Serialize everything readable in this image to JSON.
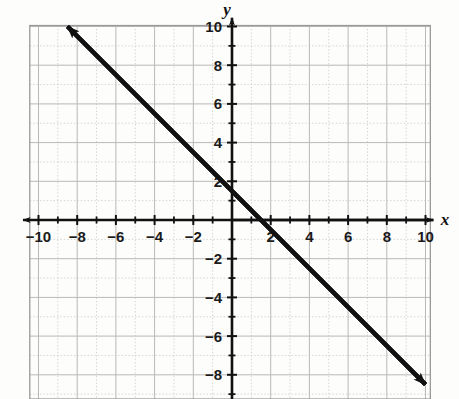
{
  "figure": {
    "kind": "coordinate-plane-line-graph",
    "background_color": "#fdfdfb",
    "axis_color": "#111111",
    "grid_major_color": "#b9b9b9",
    "grid_minor_color": "#cfcfcf",
    "line_color": "#111111"
  },
  "axes": {
    "x_axis_label": "x",
    "y_axis_label": "y",
    "x_tick_labels": [
      "−10",
      "−8",
      "−6",
      "−4",
      "−2",
      "2",
      "4",
      "6",
      "8",
      "10"
    ],
    "y_tick_labels": [
      "10",
      "8",
      "6",
      "4",
      "2",
      "−2",
      "−4",
      "−6",
      "−8"
    ]
  },
  "chart_data": {
    "type": "line",
    "title": "",
    "xlabel": "x",
    "ylabel": "y",
    "xlim": [
      -10,
      10
    ],
    "ylim": [
      -10,
      10
    ],
    "grid": true,
    "legend": "none",
    "x_ticks": [
      -10,
      -8,
      -6,
      -4,
      -2,
      2,
      4,
      6,
      8,
      10
    ],
    "y_ticks": [
      10,
      8,
      6,
      4,
      2,
      -2,
      -4,
      -6,
      -8
    ],
    "x_tick_step": 2,
    "y_tick_step": 2,
    "minor_grid_step": 1,
    "series": [
      {
        "name": "line",
        "equation": "y = -x + 1.5",
        "slope": -1,
        "y_intercept": 1.5,
        "x_intercept": 1.5,
        "arrow_start": true,
        "arrow_end": true,
        "x": [
          -8.5,
          10
        ],
        "y": [
          10,
          -8.5
        ],
        "points": [
          {
            "x": -8.5,
            "y": 10
          },
          {
            "x": -6,
            "y": 7.5
          },
          {
            "x": -4,
            "y": 5.5
          },
          {
            "x": -2,
            "y": 3.5
          },
          {
            "x": 0,
            "y": 1.5
          },
          {
            "x": 1.5,
            "y": 0
          },
          {
            "x": 4,
            "y": -2.5
          },
          {
            "x": 6,
            "y": -4.5
          },
          {
            "x": 8,
            "y": -6.5
          },
          {
            "x": 10,
            "y": -8.5
          }
        ]
      }
    ]
  }
}
